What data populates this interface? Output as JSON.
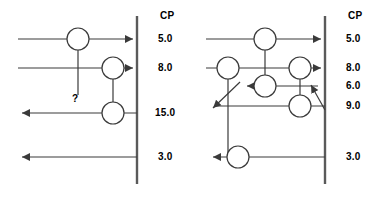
{
  "figure": {
    "title": "",
    "background": "#ffffff",
    "line_color": "#3a3a3a",
    "text_color": "#000000",
    "stroke_width": 1.2
  },
  "panels": [
    {
      "id": "left",
      "name": "left-circuit-diagram",
      "axis": {
        "name": "cp-axis",
        "header": "CP",
        "x": 137,
        "y_top": 16,
        "y_bottom": 184
      },
      "cp_values": [
        {
          "label": "5.0",
          "y": 39,
          "x": 158
        },
        {
          "label": "8.0",
          "y": 68,
          "x": 158
        },
        {
          "label": "15.0",
          "y": 113,
          "x": 158
        },
        {
          "label": "3.0",
          "y": 157,
          "x": 158
        }
      ],
      "wires": [
        {
          "name": "wire-5",
          "y": 39,
          "x1": 18,
          "x2": 137,
          "arrow": "right"
        },
        {
          "name": "wire-8",
          "y": 68,
          "x1": 18,
          "x2": 137,
          "arrow": "right"
        },
        {
          "name": "wire-15",
          "y": 113,
          "x1": 18,
          "x2": 137,
          "arrow": "left"
        },
        {
          "name": "wire-3",
          "y": 157,
          "x1": 18,
          "x2": 137,
          "arrow": "left"
        }
      ],
      "nodes": [
        {
          "name": "node-a",
          "cx": 78,
          "cy": 39,
          "r": 11
        },
        {
          "name": "node-b",
          "cx": 113,
          "cy": 68,
          "r": 11
        },
        {
          "name": "node-c",
          "cx": 113,
          "cy": 113,
          "r": 11
        }
      ],
      "connectors": [
        {
          "name": "connector-a-dangling",
          "x": 78,
          "y1": 50,
          "y2": 95
        },
        {
          "name": "connector-b-c",
          "x": 113,
          "y1": 79,
          "y2": 102
        }
      ],
      "annotations": [
        {
          "name": "question-mark",
          "text": "?",
          "x": 73,
          "y": 98
        }
      ]
    },
    {
      "id": "right",
      "name": "right-circuit-diagram",
      "axis": {
        "name": "cp-axis",
        "header": "CP",
        "x": 325,
        "y_top": 16,
        "y_bottom": 184
      },
      "cp_values": [
        {
          "label": "5.0",
          "y": 39,
          "x": 346
        },
        {
          "label": "8.0",
          "y": 68,
          "x": 346
        },
        {
          "label": "6.0",
          "y": 86,
          "x": 346
        },
        {
          "label": "9.0",
          "y": 106,
          "x": 346
        },
        {
          "label": "3.0",
          "y": 157,
          "x": 346
        }
      ],
      "wires": [
        {
          "name": "wire-5",
          "y": 39,
          "x1": 206,
          "x2": 325,
          "arrow": "right"
        },
        {
          "name": "wire-8",
          "y": 68,
          "x1": 206,
          "x2": 325,
          "arrow": "right"
        },
        {
          "name": "wire-6",
          "y": 86,
          "x1": 212,
          "x2": 318,
          "arrow": "left"
        },
        {
          "name": "wire-9",
          "y": 106,
          "x1": 206,
          "x2": 325,
          "arrow": "left"
        },
        {
          "name": "wire-3",
          "y": 157,
          "x1": 206,
          "x2": 325,
          "arrow": "left"
        }
      ],
      "nodes": [
        {
          "name": "node-a",
          "cx": 265,
          "cy": 39,
          "r": 11
        },
        {
          "name": "node-b",
          "cx": 228,
          "cy": 68,
          "r": 11
        },
        {
          "name": "node-c",
          "cx": 300,
          "cy": 68,
          "r": 11
        },
        {
          "name": "node-d",
          "cx": 265,
          "cy": 86,
          "r": 11
        },
        {
          "name": "node-e",
          "cx": 300,
          "cy": 106,
          "r": 11
        },
        {
          "name": "node-f",
          "cx": 238,
          "cy": 157,
          "r": 11
        }
      ],
      "connectors": [
        {
          "name": "connector-a-d",
          "x": 265,
          "y1": 50,
          "y2": 75
        },
        {
          "name": "connector-c-e",
          "x": 300,
          "y1": 79,
          "y2": 95
        },
        {
          "name": "connector-b-f",
          "x": 228,
          "y1": 79,
          "y2": 157
        }
      ],
      "diagonals": [
        {
          "name": "diagonal-left-crossing",
          "x1": 238,
          "y1": 84,
          "x2": 211,
          "y2": 108,
          "arrow_ends": "both"
        },
        {
          "name": "diagonal-right-crossing",
          "x1": 325,
          "y1": 108,
          "x2": 309,
          "y2": 84,
          "arrow_ends": "end"
        }
      ],
      "annotations": []
    }
  ]
}
